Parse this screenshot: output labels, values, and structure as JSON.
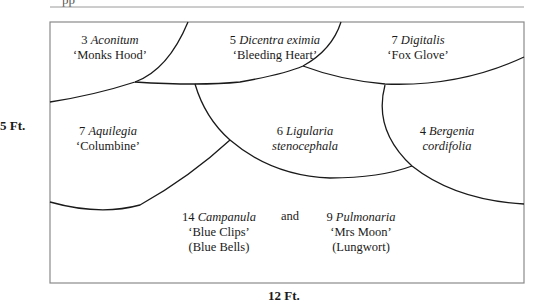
{
  "header": {
    "fragment": "pp"
  },
  "dimensions": {
    "height_label": "5 Ft.",
    "width_label": "12 Ft."
  },
  "colors": {
    "line": "#1a1a1a",
    "border": "#8a8a8a",
    "rule": "#9a9a9a",
    "background": "#ffffff"
  },
  "plants": [
    {
      "id": "aconitum",
      "count": "3",
      "latin": "Aconitum",
      "line2": "‘Monks Hood’",
      "line3": ""
    },
    {
      "id": "dicentra",
      "count": "5",
      "latin": "Dicentra eximia",
      "line2": "‘Bleeding Heart’",
      "line3": ""
    },
    {
      "id": "digitalis",
      "count": "7",
      "latin": "Digitalis",
      "line2": "‘Fox Glove’",
      "line3": ""
    },
    {
      "id": "aquilegia",
      "count": "7",
      "latin": "Aquilegia",
      "line2": "‘Columbine’",
      "line3": ""
    },
    {
      "id": "ligularia",
      "count": "6",
      "latin": "Ligularia",
      "line2": "stenocephala",
      "line3": ""
    },
    {
      "id": "bergenia",
      "count": "4",
      "latin": "Bergenia",
      "line2": "cordifolia",
      "line3": ""
    },
    {
      "id": "campanula",
      "count": "14",
      "latin": "Campanula",
      "line2": "‘Blue Clips’",
      "line3": "(Blue Bells)"
    },
    {
      "id": "pulmonaria",
      "count": "9",
      "latin": "Pulmonaria",
      "line2": "‘Mrs Moon’",
      "line3": "(Lungwort)"
    }
  ],
  "connector": "and"
}
